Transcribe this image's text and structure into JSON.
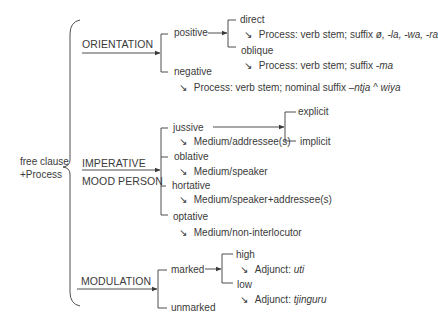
{
  "root": {
    "line1": "free clause",
    "line2": "+Process"
  },
  "systems": {
    "orientation": {
      "label": "ORIENTATION",
      "options": {
        "positive": {
          "label": "positive",
          "sub": {
            "direct": {
              "label": "direct",
              "realization_prefix": "Process: verb stem; suffix ",
              "realization_suffix": "ø, -la, -wa, -ra"
            },
            "oblique": {
              "label": "oblique",
              "realization_prefix": "Process: verb stem; suffix ",
              "realization_suffix": "-ma"
            }
          }
        },
        "negative": {
          "label": "negative",
          "realization_prefix": "Process: verb stem; nominal suffix ",
          "realization_suffix": "–ntja ^ wiya"
        }
      }
    },
    "imperative": {
      "label_line1": "IMPERATIVE",
      "label_line2": "MOOD PERSON",
      "options": {
        "jussive": {
          "label": "jussive",
          "realization": "Medium/addressee(s)",
          "sub": {
            "explicit": "explicit",
            "implicit": "implicit"
          }
        },
        "oblative": {
          "label": "oblative",
          "realization": "Medium/speaker"
        },
        "hortative": {
          "label": "hortative",
          "realization": "Medium/speaker+addressee(s)"
        },
        "optative": {
          "label": "optative",
          "realization": "Medium/non-interlocutor"
        }
      }
    },
    "modulation": {
      "label": "MODULATION",
      "options": {
        "marked": {
          "label": "marked",
          "sub": {
            "high": {
              "label": "high",
              "realization_prefix": "Adjunct: ",
              "realization_value": "uti"
            },
            "low": {
              "label": "low",
              "realization_prefix": "Adjunct: ",
              "realization_value": "tjinguru"
            }
          }
        },
        "unmarked": {
          "label": "unmarked"
        }
      }
    }
  },
  "glyphs": {
    "realization_arrow": "↘"
  },
  "colors": {
    "line": "#3a3a3a",
    "text": "#3a3a3a",
    "background": "#ffffff"
  }
}
